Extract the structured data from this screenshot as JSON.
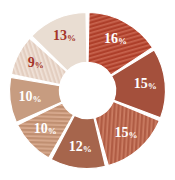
{
  "chart_data": {
    "type": "pie",
    "variant": "donut",
    "title": "",
    "subtitle": "",
    "xlabel": "",
    "ylabel": "",
    "grid": false,
    "legend": "none",
    "start_angle_deg": 0,
    "direction": "clockwise",
    "inner_radius_ratio": 0.36,
    "gap_deg": 2.2,
    "labels": [
      "16%",
      "15%",
      "15%",
      "12%",
      "10%",
      "10%",
      "9%",
      "13%"
    ],
    "values": [
      16,
      15,
      15,
      12,
      10,
      10,
      9,
      13
    ],
    "categories": [
      "16%",
      "15%",
      "15%",
      "12%",
      "10%",
      "10%",
      "9%",
      "13%"
    ],
    "total": 100,
    "slices": [
      {
        "label": "16%",
        "value": 16,
        "color": "#ae3f2a",
        "hatch": true,
        "hatch_color": "#c8644e",
        "label_color": "#ffffff"
      },
      {
        "label": "15%",
        "value": 15,
        "color": "#a4503c",
        "hatch": false,
        "hatch_color": "#bd6c56",
        "label_color": "#ffffff"
      },
      {
        "label": "15%",
        "value": 15,
        "color": "#b05c44",
        "hatch": true,
        "hatch_color": "#cb7d63",
        "label_color": "#ffffff"
      },
      {
        "label": "12%",
        "value": 12,
        "color": "#a6654c",
        "hatch": false,
        "hatch_color": "#bd8068",
        "label_color": "#ffffff"
      },
      {
        "label": "10%",
        "value": 10,
        "color": "#c08f71",
        "hatch": true,
        "hatch_color": "#d9ab90",
        "label_color": "#ffffff"
      },
      {
        "label": "10%",
        "value": 10,
        "color": "#c79c80",
        "hatch": false,
        "hatch_color": "#dcb69d",
        "label_color": "#ffffff"
      },
      {
        "label": "9%",
        "value": 9,
        "color": "#e3cec0",
        "hatch": true,
        "hatch_color": "#f0e2d8",
        "label_color": "#a5352a"
      },
      {
        "label": "13%",
        "value": 13,
        "color": "#e9ddd2",
        "hatch": false,
        "hatch_color": "#f3ece4",
        "label_color": "#a5352a"
      }
    ],
    "colors": [
      "#ae3f2a",
      "#a4503c",
      "#b05c44",
      "#a6654c",
      "#c08f71",
      "#c79c80",
      "#e3cec0",
      "#e9ddd2"
    ],
    "background_color": "#ffffff",
    "separator_color": "#ffffff"
  }
}
